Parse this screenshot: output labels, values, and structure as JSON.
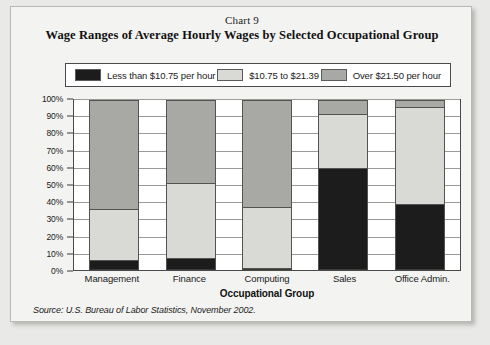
{
  "header": {
    "chart_number": "Chart 9",
    "title": "Wage Ranges of Average Hourly Wages by Selected Occupational Group"
  },
  "legend": {
    "items": [
      {
        "label": "Less than $10.75 per hour",
        "color": "#1c1c1c",
        "swatch_name": "legend-swatch-low"
      },
      {
        "label": "$10.75 to $21.39",
        "color": "#d9d9d6",
        "swatch_name": "legend-swatch-mid"
      },
      {
        "label": "Over $21.50 per hour",
        "color": "#a8a8a4",
        "swatch_name": "legend-swatch-high"
      }
    ]
  },
  "source": "Source: U.S. Bureau of Labor Statistics, November 2002.",
  "chart_data": {
    "type": "bar",
    "subtype": "stacked-100-percent",
    "title": "Wage Ranges of Average Hourly Wages by Selected Occupational Group",
    "xlabel": "Occupational Group",
    "ylabel": "",
    "ylim": [
      0,
      100
    ],
    "yticks": [
      "0%",
      "10%",
      "20%",
      "30%",
      "40%",
      "50%",
      "60%",
      "70%",
      "80%",
      "90%",
      "100%"
    ],
    "ytick_values": [
      0,
      10,
      20,
      30,
      40,
      50,
      60,
      70,
      80,
      90,
      100
    ],
    "grid": true,
    "legend_position": "top",
    "categories": [
      "Management",
      "Finance",
      "Computing",
      "Sales",
      "Office Admin."
    ],
    "series": [
      {
        "name": "Less than $10.75 per hour",
        "color": "#1c1c1c",
        "values": [
          6,
          7,
          1,
          60,
          39
        ]
      },
      {
        "name": "$10.75 to $21.39",
        "color": "#d9d9d6",
        "values": [
          30,
          44,
          36,
          32,
          57
        ]
      },
      {
        "name": "Over $21.50 per hour",
        "color": "#a8a8a4",
        "values": [
          64,
          49,
          63,
          8,
          4
        ]
      }
    ]
  }
}
